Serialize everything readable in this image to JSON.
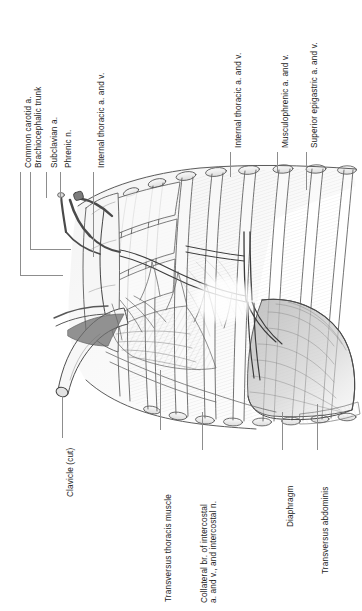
{
  "plate": {
    "width": 362,
    "height": 611,
    "background_color": "#ffffff",
    "ink_color": "#3a3a3a",
    "leader_color": "#8d8d8d",
    "label_color": "#1b1b1b",
    "subject": "anterior thoracic wall, internal (posterior) view",
    "style": "graphite pencil anatomical illustration"
  },
  "labels": {
    "common_carotid": "Common carotid a.",
    "brachiocephalic_trunk": "Brachiocephalic trunk",
    "subclavian": "Subclavian a.",
    "phrenic_nerve": "Phrenic n.",
    "internal_thoracic_left": "Internal thoracic a. and v.",
    "internal_thoracic_right": "Internal thoracic a. and v.",
    "musculophrenic": "Musculophrenic a. and v.",
    "superior_epigastric": "Superior epigastric a. and v.",
    "clavicle_cut": "Clavicle (cut)",
    "transversus_thoracis": "Transversus thoracis muscle",
    "collateral_branch_line1": "Collateral br. of intercostal",
    "collateral_branch_line2": "a. and v., and intercostal n.",
    "diaphragm": "Diaphragm",
    "transversus_abdominis": "Transversus abdominis"
  },
  "figure_structures": [
    "cut clavicle",
    "costal cartilages",
    "ribs (cut ends)",
    "internal intercostal membrane",
    "transversus thoracis muscle",
    "internal thoracic vessels",
    "musculophrenic vessels",
    "superior epigastric vessels",
    "diaphragm",
    "transversus abdominis",
    "phrenic nerve",
    "subclavian artery",
    "brachiocephalic trunk",
    "common carotid artery"
  ]
}
